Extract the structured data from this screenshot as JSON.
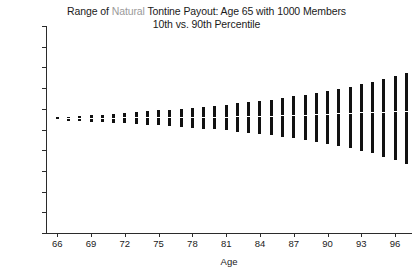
{
  "chart_data": {
    "type": "bar",
    "title": "Range of Natural Tontine Payout: Age 65 with 1000 Members",
    "subtitle": "10th vs. 90th Percentile",
    "title_parts": [
      {
        "text": "Range of ",
        "dim": false
      },
      {
        "text": "Natural",
        "dim": true
      },
      {
        "text": " Tontine Payout: Age 65 with 1000 Members",
        "dim": false
      }
    ],
    "xlabel": "Age",
    "ylabel": "",
    "xlim": [
      65,
      97.5
    ],
    "ylim": [
      500,
      1000
    ],
    "xticks": [
      66,
      69,
      72,
      75,
      78,
      81,
      84,
      87,
      90,
      93,
      96
    ],
    "xticklabels": [
      "66",
      "69",
      "72",
      "75",
      "78",
      "81",
      "84",
      "87",
      "90",
      "93",
      "96"
    ],
    "yticks": [
      500,
      550,
      600,
      650,
      700,
      750,
      800,
      850,
      900,
      950,
      1000
    ],
    "yticklabels": [
      "$500",
      "$550",
      "$600",
      "$650",
      "$700",
      "$750",
      "$800",
      "$850",
      "$900",
      "$950",
      "$1,000"
    ],
    "grid": false,
    "legend": null,
    "series_names": [
      "10th percentile",
      "90th percentile"
    ],
    "bar_color": "#111111",
    "categories": [
      66,
      67,
      68,
      69,
      70,
      71,
      72,
      73,
      74,
      75,
      76,
      77,
      78,
      79,
      80,
      81,
      82,
      83,
      84,
      85,
      86,
      87,
      88,
      89,
      90,
      91,
      92,
      93,
      94,
      95,
      96,
      97
    ],
    "p10": [
      772,
      771,
      770,
      769,
      768,
      766,
      765,
      763,
      761,
      760,
      758,
      756,
      754,
      752,
      750,
      748,
      745,
      742,
      739,
      736,
      733,
      729,
      725,
      721,
      716,
      711,
      705,
      699,
      692,
      684,
      676,
      666
    ],
    "p90": [
      779,
      781,
      783,
      784,
      786,
      788,
      790,
      792,
      794,
      796,
      798,
      800,
      803,
      805,
      807,
      810,
      813,
      816,
      819,
      822,
      826,
      830,
      834,
      838,
      843,
      848,
      853,
      859,
      865,
      872,
      879,
      887
    ],
    "median": [
      775,
      776,
      776,
      777,
      777,
      777,
      778,
      778,
      778,
      778,
      779,
      779,
      779,
      779,
      780,
      780,
      781,
      781,
      782,
      782,
      783,
      784,
      785,
      786,
      787,
      788,
      789,
      790,
      791,
      792,
      793,
      794
    ]
  }
}
